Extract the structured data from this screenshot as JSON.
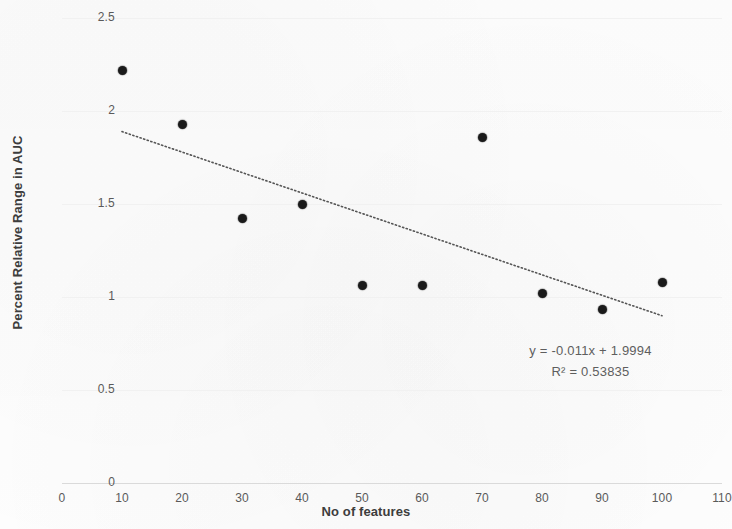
{
  "chart_data": {
    "type": "scatter",
    "title": "",
    "xlabel": "No of features",
    "ylabel": "Percent Relative Range in AUC",
    "xlim": [
      0,
      110
    ],
    "ylim": [
      0,
      2.5
    ],
    "xticks": [
      0,
      10,
      20,
      30,
      40,
      50,
      60,
      70,
      80,
      90,
      100,
      110
    ],
    "xtick_labels": [
      "0",
      "10",
      "20",
      "30",
      "40",
      "50",
      "60",
      "70",
      "80",
      "90",
      "100",
      "110"
    ],
    "yticks": [
      0,
      0.5,
      1,
      1.5,
      2,
      2.5
    ],
    "ytick_labels": [
      "0",
      "0.5",
      "1",
      "1.5",
      "2",
      "2.5"
    ],
    "grid": true,
    "legend": false,
    "x": [
      10,
      20,
      30,
      40,
      50,
      60,
      70,
      80,
      90,
      100
    ],
    "y": [
      2.22,
      1.93,
      1.42,
      1.5,
      1.06,
      1.06,
      1.855,
      1.02,
      0.935,
      1.08
    ],
    "marker_color": "#1a1a1a",
    "trendline": {
      "type": "linear",
      "style": "dotted",
      "color": "#555555",
      "slope": -0.011,
      "intercept": 1.9994,
      "x_start": 10,
      "x_end": 100,
      "y_start": 1.8894,
      "y_end": 0.8994
    },
    "annotations": {
      "equation": "y = -0.011x + 1.9994",
      "r_squared": "R² = 0.53835"
    }
  },
  "colors": {
    "background": "#fdfdfd",
    "gridline": "#f1f1f1",
    "axis": "#dadada",
    "tick_text": "#5a5a5a",
    "title_text": "#3d3d3d",
    "annotation_text": "#5e5e5e"
  }
}
